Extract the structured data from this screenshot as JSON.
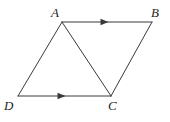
{
  "figure": {
    "kind": "geometry-diagram",
    "background_color": "#ffffff",
    "stroke_color": "#3a3a3c",
    "stroke_width": 1,
    "labels": {
      "A": "A",
      "B": "B",
      "C": "C",
      "D": "D"
    },
    "vertices": {
      "A": {
        "x": 62,
        "y": 22
      },
      "B": {
        "x": 152,
        "y": 22
      },
      "C": {
        "x": 111,
        "y": 96
      },
      "D": {
        "x": 18,
        "y": 96
      }
    },
    "segments": [
      {
        "name": "AB",
        "from": "A",
        "to": "B",
        "arrow": true
      },
      {
        "name": "BC",
        "from": "B",
        "to": "C",
        "arrow": false
      },
      {
        "name": "DC",
        "from": "D",
        "to": "C",
        "arrow": true
      },
      {
        "name": "AD",
        "from": "A",
        "to": "D",
        "arrow": false
      },
      {
        "name": "AC",
        "from": "A",
        "to": "C",
        "arrow": false
      }
    ],
    "arrow_marks": [
      {
        "on": "AB",
        "x": 107,
        "y": 22,
        "direction": "right"
      },
      {
        "on": "DC",
        "x": 64,
        "y": 96,
        "direction": "right"
      }
    ]
  }
}
